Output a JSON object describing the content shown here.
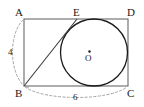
{
  "figure": {
    "shape_type": "geometry-diagram",
    "vertices": {
      "a": {
        "label": "A",
        "x": 24,
        "y": 19
      },
      "b": {
        "label": "B",
        "x": 24,
        "y": 86
      },
      "c": {
        "label": "C",
        "x": 128,
        "y": 86
      },
      "d": {
        "label": "D",
        "x": 128,
        "y": 19
      },
      "e": {
        "label": "E",
        "x": 77,
        "y": 19
      }
    },
    "circle": {
      "center_label": "O",
      "center_dot_label": "center-dot",
      "cx": 94,
      "cy": 52.5,
      "r": 33.5
    },
    "measures": {
      "side_ab": {
        "value": "4",
        "side": "AB",
        "style": "dashed-arc"
      },
      "side_bc": {
        "value": "6",
        "side": "BC",
        "style": "dashed-arc"
      }
    },
    "colors": {
      "stroke": "#4a4a4a",
      "circle_stroke": "#1a1a1a",
      "dashed_stroke": "#8a8a8a",
      "text": "#1a1a1a",
      "background": "#ffffff"
    }
  }
}
